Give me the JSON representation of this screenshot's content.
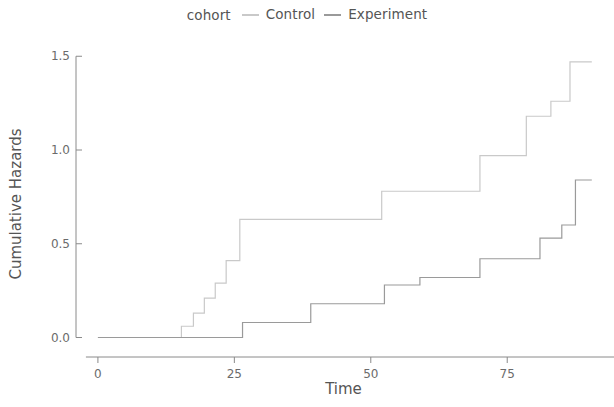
{
  "legend": {
    "title": "cohort",
    "entries": [
      {
        "label": "Control",
        "color": "#c9c9c9",
        "key": "line-dash"
      },
      {
        "label": "Experiment",
        "color": "#9a9a9a",
        "key": "line-dash"
      }
    ]
  },
  "axes": {
    "x_title": "Time",
    "y_title": "Cumulative Hazards",
    "x_ticks": [
      "0",
      "25",
      "50",
      "75"
    ],
    "y_ticks": [
      "0.0",
      "0.5",
      "1.0",
      "1.5"
    ]
  },
  "chart_data": {
    "type": "line",
    "subtype": "step",
    "title": "",
    "xlabel": "Time",
    "ylabel": "Cumulative Hazards",
    "xlim": [
      -2,
      92
    ],
    "ylim": [
      -0.04,
      1.56
    ],
    "xticks": [
      0,
      25,
      50,
      75
    ],
    "yticks": [
      0.0,
      0.5,
      1.0,
      1.5
    ],
    "grid": false,
    "legend_position": "top-center",
    "legend_title": "cohort",
    "series": [
      {
        "name": "Control",
        "color": "#c9c9c9",
        "x": [
          0,
          15.3,
          17.5,
          19.5,
          21.5,
          23.5,
          26.0,
          52.0,
          70.0,
          78.5,
          83.0,
          86.5,
          90.5
        ],
        "y": [
          0.0,
          0.06,
          0.13,
          0.21,
          0.29,
          0.41,
          0.63,
          0.78,
          0.97,
          1.18,
          1.26,
          1.47,
          1.47
        ]
      },
      {
        "name": "Experiment",
        "color": "#9a9a9a",
        "x": [
          0,
          26.5,
          39.0,
          52.5,
          59.0,
          70.0,
          81.0,
          85.0,
          87.5,
          90.5
        ],
        "y": [
          0.0,
          0.08,
          0.18,
          0.28,
          0.32,
          0.42,
          0.53,
          0.6,
          0.84,
          0.84
        ]
      }
    ]
  },
  "style": {
    "axis_color": "#8a8a8a",
    "text_color": "#555555",
    "tick_text_color": "#6b6b6b",
    "background": "#ffffff"
  }
}
